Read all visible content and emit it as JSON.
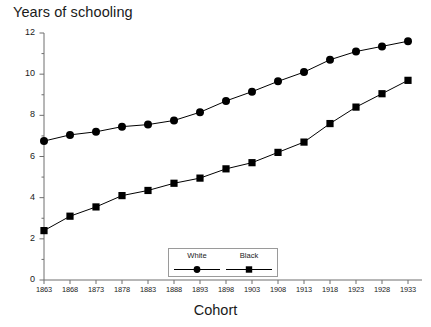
{
  "chart_data": {
    "type": "line",
    "title": "Years of schooling",
    "xlabel": "Cohort",
    "ylabel": "Years of schooling",
    "categories": [
      "1863",
      "1868",
      "1873",
      "1878",
      "1883",
      "1888",
      "1893",
      "1898",
      "1903",
      "1908",
      "1913",
      "1918",
      "1923",
      "1928",
      "1933"
    ],
    "x": [
      1863,
      1868,
      1873,
      1878,
      1883,
      1888,
      1893,
      1898,
      1903,
      1908,
      1913,
      1918,
      1923,
      1928,
      1933
    ],
    "xlim": [
      1863,
      1933
    ],
    "ylim": [
      0,
      12
    ],
    "yticks": [
      0,
      2,
      4,
      6,
      8,
      10,
      12
    ],
    "ytick_labels": [
      "0",
      "2",
      "4",
      "6",
      "8",
      "10",
      "12"
    ],
    "yminor_ticks": [
      1,
      3,
      5,
      7,
      9,
      11
    ],
    "grid": false,
    "legend_position": "bottom-center",
    "series": [
      {
        "name": "White",
        "marker": "circle",
        "color": "#000000",
        "values": [
          6.75,
          7.05,
          7.2,
          7.45,
          7.55,
          7.75,
          8.15,
          8.7,
          9.15,
          9.65,
          10.1,
          10.7,
          11.1,
          11.35,
          11.6
        ]
      },
      {
        "name": "Black",
        "marker": "square",
        "color": "#000000",
        "values": [
          2.4,
          3.1,
          3.55,
          4.1,
          4.35,
          4.7,
          4.95,
          5.4,
          5.7,
          6.2,
          6.7,
          7.6,
          8.4,
          9.05,
          9.7
        ]
      }
    ]
  },
  "legend": {
    "entries": [
      {
        "label": "White",
        "marker": "circle"
      },
      {
        "label": "Black",
        "marker": "square"
      }
    ]
  },
  "colors": {
    "axis": "#6e6e6e",
    "ink": "#1a1a1a",
    "series": "#000000",
    "legend_border": "#9a9a9a",
    "background": "#ffffff"
  }
}
